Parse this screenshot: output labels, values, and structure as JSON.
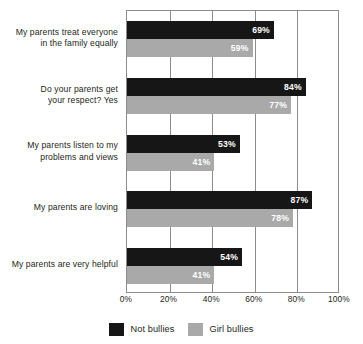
{
  "chart_data": {
    "type": "bar",
    "orientation": "horizontal",
    "title": "",
    "xlabel": "",
    "ylabel": "",
    "xlim": [
      0,
      100
    ],
    "xticks": [
      "0%",
      "20%",
      "40%",
      "60%",
      "80%",
      "100%"
    ],
    "xtick_values": [
      0,
      20,
      40,
      60,
      80,
      100
    ],
    "grid": true,
    "legend_position": "bottom",
    "categories": [
      "My parents treat everyone in the family equally",
      "Do your parents get your respect? Yes",
      "My parents listen to my problems and views",
      "My parents are loving",
      "My parents are very helpful"
    ],
    "category_lines": [
      [
        "My parents treat everyone",
        "in the family equally"
      ],
      [
        "Do your parents get",
        "your respect? Yes"
      ],
      [
        "My parents listen to my",
        "problems and views"
      ],
      [
        "My parents are loving"
      ],
      [
        "My parents are very helpful"
      ]
    ],
    "series": [
      {
        "name": "Not bullies",
        "color": "#161616",
        "values": [
          69,
          84,
          53,
          87,
          54
        ],
        "labels": [
          "69%",
          "84%",
          "53%",
          "87%",
          "54%"
        ]
      },
      {
        "name": "Girl bullies",
        "color": "#a9a9a9",
        "values": [
          59,
          77,
          41,
          78,
          41
        ],
        "labels": [
          "59%",
          "77%",
          "41%",
          "78%",
          "41%"
        ]
      }
    ]
  },
  "legend": {
    "items": [
      {
        "label": "Not bullies",
        "color": "#161616"
      },
      {
        "label": "Girl bullies",
        "color": "#a9a9a9"
      }
    ]
  }
}
